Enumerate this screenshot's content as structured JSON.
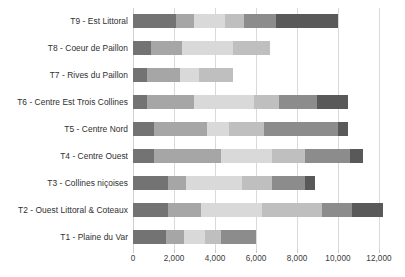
{
  "chart_data": {
    "type": "bar",
    "orientation": "horizontal",
    "stacked": true,
    "title": "",
    "subtitle": "",
    "xlabel": "",
    "ylabel": "",
    "xlim": [
      0,
      12000
    ],
    "xticks": [
      0,
      2000,
      4000,
      6000,
      8000,
      10000,
      12000
    ],
    "xtick_labels": [
      "0",
      "2,000",
      "4,000",
      "6,000",
      "8,000",
      "10,000",
      "12,000"
    ],
    "grid": "vertical",
    "legend": "none",
    "categories": [
      "T9 - Est Littoral",
      "T8 - Coeur de Paillon",
      "T7 - Rives du Paillon",
      "T6 - Centre Est Trois Collines",
      "T5 - Centre Nord",
      "T4 - Centre Ouest",
      "T3 - Collines niçoises",
      "T2 - Ouest Littoral & Coteaux",
      "T1 - Plaine du Var"
    ],
    "series": [
      {
        "name": "s1",
        "color": "#737373",
        "values": [
          2100,
          900,
          700,
          700,
          1000,
          1000,
          1700,
          1700,
          1600
        ]
      },
      {
        "name": "s2",
        "color": "#a6a6a6",
        "values": [
          900,
          1500,
          1600,
          2300,
          2600,
          3300,
          900,
          1600,
          900
        ]
      },
      {
        "name": "s3",
        "color": "#d9d9d9",
        "values": [
          1500,
          2500,
          900,
          2900,
          1100,
          2500,
          2700,
          3000,
          1000
        ]
      },
      {
        "name": "s4",
        "color": "#bfbfbf",
        "values": [
          900,
          1800,
          1700,
          1200,
          1700,
          1600,
          1500,
          2900,
          800
        ]
      },
      {
        "name": "s5",
        "color": "#8c8c8c",
        "values": [
          1600,
          0,
          0,
          1900,
          3600,
          2200,
          1600,
          1500,
          1700
        ]
      },
      {
        "name": "s6",
        "color": "#595959",
        "values": [
          3000,
          0,
          0,
          1500,
          500,
          600,
          500,
          1500,
          0
        ]
      }
    ],
    "totals": [
      10000,
      6700,
      4900,
      10500,
      10500,
      11200,
      8900,
      12200,
      6000
    ]
  }
}
